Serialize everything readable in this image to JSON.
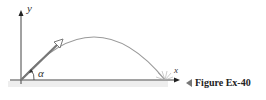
{
  "figure": {
    "axis_labels": {
      "x": "x",
      "y": "y"
    },
    "angle_label": "α",
    "caption": "Figure Ex-40",
    "colors": {
      "axes": "#444444",
      "trajectory": "#9a9a9a",
      "velocity_arrow": "#888888",
      "ground": "#e6e6e6",
      "caption_marker": "#777777"
    }
  }
}
